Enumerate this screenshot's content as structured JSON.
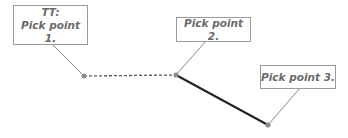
{
  "diagram": {
    "callouts": [
      {
        "lines": [
          "TT:",
          "Pick point 1."
        ]
      },
      {
        "lines": [
          "Pick point 2."
        ]
      },
      {
        "lines": [
          "Pick point 3."
        ]
      }
    ],
    "points": [
      {
        "label": "point-1",
        "x": 84,
        "y": 76
      },
      {
        "label": "point-2",
        "x": 176,
        "y": 75
      },
      {
        "label": "point-3",
        "x": 268,
        "y": 125
      }
    ],
    "segments": [
      {
        "from": "point-1",
        "to": "point-2",
        "style": "dashed",
        "color": "#555555"
      },
      {
        "from": "point-2",
        "to": "point-3",
        "style": "solid",
        "color": "#222222"
      }
    ],
    "colors": {
      "leader": "#8a8a8a",
      "point": "#8a8a8a",
      "box_border": "#9a9a9a",
      "text": "#6a6a6a"
    }
  }
}
